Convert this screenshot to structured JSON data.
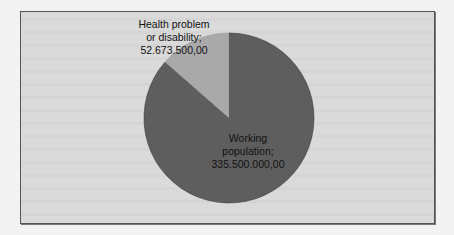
{
  "chart_data": {
    "type": "pie",
    "title": "",
    "categories": [
      "Health problem or disability",
      "Working population"
    ],
    "values": [
      52673500.0,
      335500000.0
    ],
    "value_labels": [
      "52.673.500,00",
      "335.500.000,00"
    ],
    "percentages": [
      13.57,
      86.43
    ],
    "colors": [
      "#a9a9a9",
      "#5e5e5e"
    ],
    "start_angle": "12 o'clock, slice 1 counter-clockwise",
    "legend": "none (data labels on slices)",
    "grid": false
  },
  "labels": {
    "health": {
      "line1": "Health problem",
      "line2": "or disability;",
      "value": "52.673.500,00"
    },
    "working": {
      "line1": "Working",
      "line2": "population;",
      "value": "335.500.000,00"
    }
  },
  "colors": {
    "frame_background": "#dadada",
    "frame_border": "#555555",
    "slice_health": "#a9a9a9",
    "slice_working": "#5e5e5e"
  }
}
